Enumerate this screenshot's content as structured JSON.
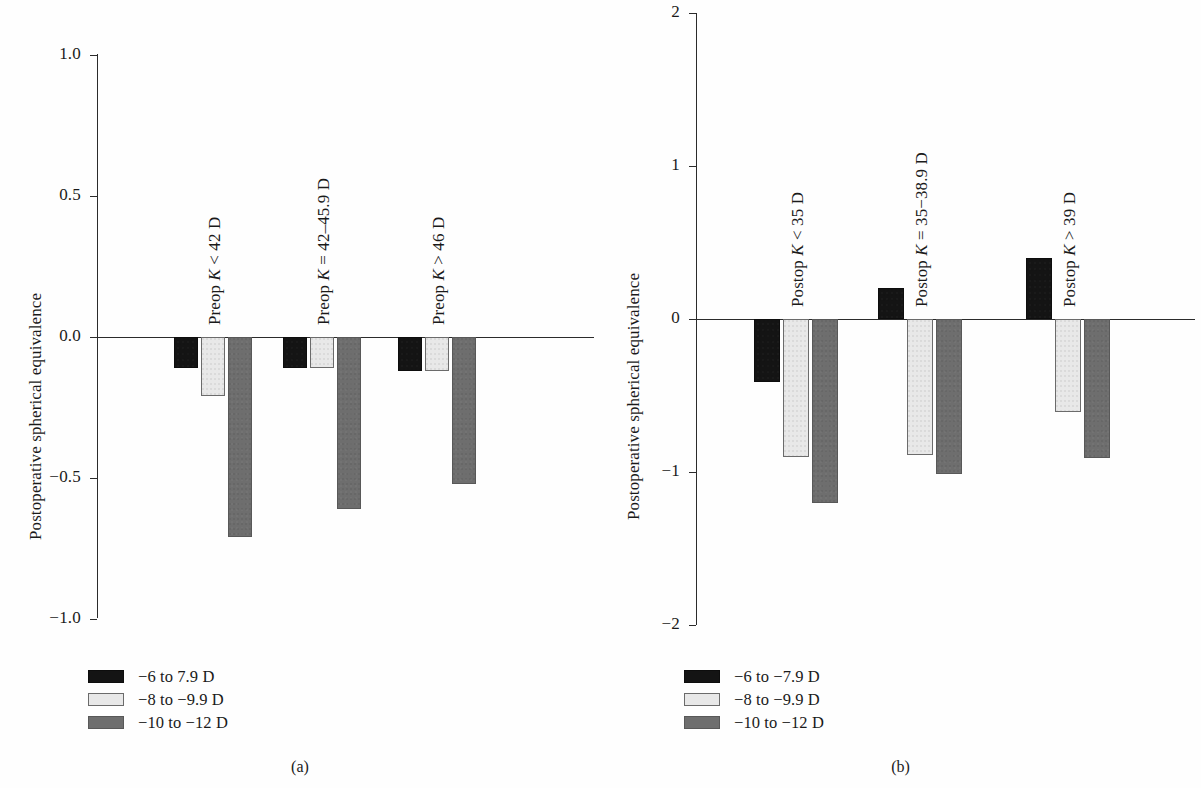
{
  "figure": {
    "background": "#ffffff",
    "series_colors": [
      "#141414",
      "#e8e8e8",
      "#6e6e6e"
    ]
  },
  "panels": [
    {
      "id": "a",
      "caption": "(a)",
      "ylabel": "Postoperative spherical equivalence",
      "yticks": [
        "1.0",
        "0.5",
        "0.0",
        "−0.5",
        "−1.0"
      ],
      "group_labels": [
        {
          "prefix": "Preop ",
          "italic": "K",
          "suffix": " < 42 D"
        },
        {
          "prefix": "Preop ",
          "italic": "K",
          "suffix": " = 42–45.9 D"
        },
        {
          "prefix": "Preop ",
          "italic": "K",
          "suffix": " > 46 D"
        }
      ],
      "legend": [
        "−6 to 7.9 D",
        "−8 to −9.9 D",
        "−10 to −12 D"
      ]
    },
    {
      "id": "b",
      "caption": "(b)",
      "ylabel": "Postoperative spherical equivalence",
      "yticks": [
        "2",
        "1",
        "0",
        "−1",
        "−2"
      ],
      "group_labels": [
        {
          "prefix": "Postop ",
          "italic": "K",
          "suffix": " < 35 D"
        },
        {
          "prefix": "Postop ",
          "italic": "K",
          "suffix": " = 35−38.9 D"
        },
        {
          "prefix": "Postop ",
          "italic": "K",
          "suffix": " > 39 D"
        }
      ],
      "legend": [
        "−6 to −7.9 D",
        "−8 to −9.9 D",
        "−10 to −12 D"
      ]
    }
  ],
  "chart_data": [
    {
      "type": "bar",
      "panel": "a",
      "title": "",
      "xlabel": "",
      "ylabel": "Postoperative spherical equivalence",
      "ylim": [
        -1.0,
        1.0
      ],
      "ytick_values": [
        1.0,
        0.5,
        0.0,
        -0.5,
        -1.0
      ],
      "grid": false,
      "legend_position": "below-left",
      "categories": [
        "Preop K < 42 D",
        "Preop K = 42–45.9 D",
        "Preop K > 46 D"
      ],
      "series": [
        {
          "name": "−6 to 7.9 D",
          "color": "#141414",
          "values": [
            -0.11,
            -0.11,
            -0.12
          ]
        },
        {
          "name": "−8 to −9.9 D",
          "color": "#e8e8e8",
          "values": [
            -0.21,
            -0.11,
            -0.12
          ]
        },
        {
          "name": "−10 to −12 D",
          "color": "#6e6e6e",
          "values": [
            -0.71,
            -0.61,
            -0.52
          ]
        }
      ]
    },
    {
      "type": "bar",
      "panel": "b",
      "title": "",
      "xlabel": "",
      "ylabel": "Postoperative spherical equivalence",
      "ylim": [
        -2,
        2
      ],
      "ytick_values": [
        2,
        1,
        0,
        -1,
        -2
      ],
      "grid": false,
      "legend_position": "below-left",
      "categories": [
        "Postop K < 35 D",
        "Postop K = 35−38.9 D",
        "Postop K > 39 D"
      ],
      "series": [
        {
          "name": "−6 to −7.9 D",
          "color": "#141414",
          "values": [
            -0.41,
            0.2,
            0.4
          ]
        },
        {
          "name": "−8 to −9.9 D",
          "color": "#e8e8e8",
          "values": [
            -0.9,
            -0.89,
            -0.61
          ]
        },
        {
          "name": "−10 to −12 D",
          "color": "#6e6e6e",
          "values": [
            -1.2,
            -1.01,
            -0.91
          ]
        }
      ]
    }
  ]
}
